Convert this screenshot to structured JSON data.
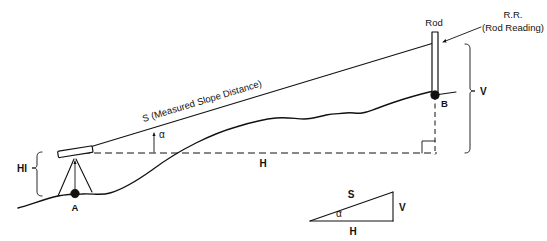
{
  "figure": {
    "labels": {
      "slope_distance": "S (Measured Slope Distance)",
      "rod": "Rod",
      "rod_reading_abbr": "R.R.",
      "rod_reading_full": "(Rod Reading)",
      "vertical": "V",
      "horizontal": "H",
      "height_of_instrument": "HI",
      "angle": "α",
      "point_a": "A",
      "point_b": "B"
    },
    "inset_triangle": {
      "hypotenuse": "S",
      "vertical": "V",
      "horizontal": "H",
      "angle": "α"
    },
    "colors": {
      "ink": "#111111",
      "paper": "#ffffff"
    }
  }
}
